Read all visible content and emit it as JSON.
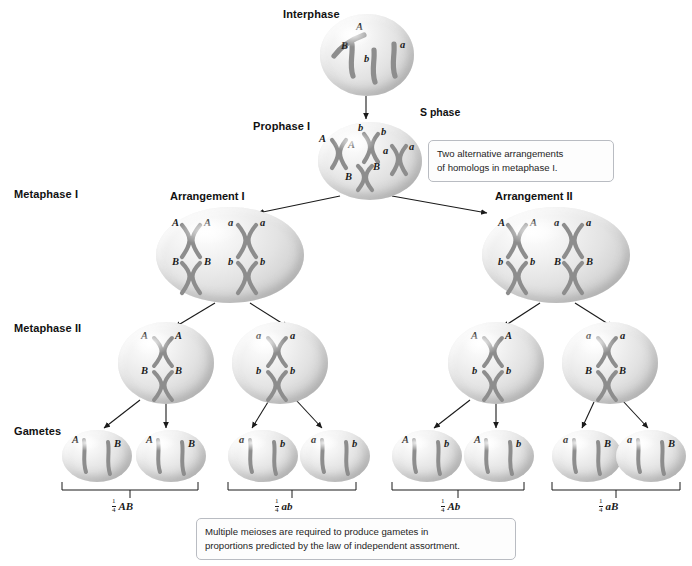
{
  "figure": {
    "stage_labels": [
      {
        "id": "interphase",
        "text": "Interphase"
      },
      {
        "id": "prophase-i",
        "text": "Prophase I"
      },
      {
        "id": "metaphase-i",
        "text": "Metaphase I"
      },
      {
        "id": "metaphase-ii",
        "text": "Metaphase II"
      },
      {
        "id": "gametes",
        "text": "Gametes"
      }
    ],
    "s_phase_label": "S phase",
    "arrangement_labels": [
      {
        "id": "arrangement-1",
        "text": "Arrangement I"
      },
      {
        "id": "arrangement-2",
        "text": "Arrangement II"
      }
    ],
    "callouts": [
      {
        "id": "callout-metaphase",
        "line1": "Two alternative arrangements",
        "line2": "of homologs in metaphase I."
      },
      {
        "id": "callout-gametes",
        "line1": "Multiple meioses are required to produce gametes in",
        "line2": "proportions predicted by the law of independent assortment."
      }
    ],
    "cells": {
      "interphase": {
        "name": "interphase-cell",
        "chromosome_labels": [
          "A",
          "B",
          "b",
          "a"
        ]
      },
      "prophase_i": {
        "name": "prophase-i-cell",
        "chromosome_labels": [
          "A",
          "A",
          "b",
          "b",
          "B",
          "B",
          "a",
          "a"
        ]
      },
      "metaphase_i": [
        {
          "name": "metaphase-i-cell-arrangement-1",
          "top_row": [
            "A",
            "A",
            "a",
            "a"
          ],
          "bottom_row": [
            "B",
            "B",
            "b",
            "b"
          ]
        },
        {
          "name": "metaphase-i-cell-arrangement-2",
          "top_row": [
            "A",
            "A",
            "a",
            "a"
          ],
          "bottom_row": [
            "b",
            "b",
            "B",
            "B"
          ]
        }
      ],
      "metaphase_ii": [
        {
          "name": "metaphase-ii-cell-1",
          "top_row": [
            "A",
            "A"
          ],
          "bottom_row": [
            "B",
            "B"
          ]
        },
        {
          "name": "metaphase-ii-cell-2",
          "top_row": [
            "a",
            "a"
          ],
          "bottom_row": [
            "b",
            "b"
          ]
        },
        {
          "name": "metaphase-ii-cell-3",
          "top_row": [
            "A",
            "A"
          ],
          "bottom_row": [
            "b",
            "b"
          ]
        },
        {
          "name": "metaphase-ii-cell-4",
          "top_row": [
            "a",
            "a"
          ],
          "bottom_row": [
            "B",
            "B"
          ]
        }
      ],
      "gametes": [
        {
          "name": "gamete-cell-1",
          "left": "A",
          "right": "B"
        },
        {
          "name": "gamete-cell-2",
          "left": "A",
          "right": "B"
        },
        {
          "name": "gamete-cell-3",
          "left": "a",
          "right": "b"
        },
        {
          "name": "gamete-cell-4",
          "left": "a",
          "right": "b"
        },
        {
          "name": "gamete-cell-5",
          "left": "A",
          "right": "b"
        },
        {
          "name": "gamete-cell-6",
          "left": "A",
          "right": "b"
        },
        {
          "name": "gamete-cell-7",
          "left": "a",
          "right": "B"
        },
        {
          "name": "gamete-cell-8",
          "left": "a",
          "right": "B"
        }
      ]
    },
    "gamete_proportions": [
      {
        "id": "proportion-ab",
        "numerator": "1",
        "denominator": "4",
        "genotype": "AB"
      },
      {
        "id": "proportion-ab-lower",
        "numerator": "1",
        "denominator": "4",
        "genotype": "ab"
      },
      {
        "id": "proportion-Ab",
        "numerator": "1",
        "denominator": "4",
        "genotype": "Ab"
      },
      {
        "id": "proportion-aB",
        "numerator": "1",
        "denominator": "4",
        "genotype": "aB"
      }
    ],
    "colors": {
      "background": "#ffffff",
      "cell_fill": "#e3e3e3",
      "chromosome": "#8d8d8d",
      "chromosome_dark": "#6e6e6e",
      "text": "#1a1a1a",
      "callout_border": "#b9bcc2"
    }
  }
}
